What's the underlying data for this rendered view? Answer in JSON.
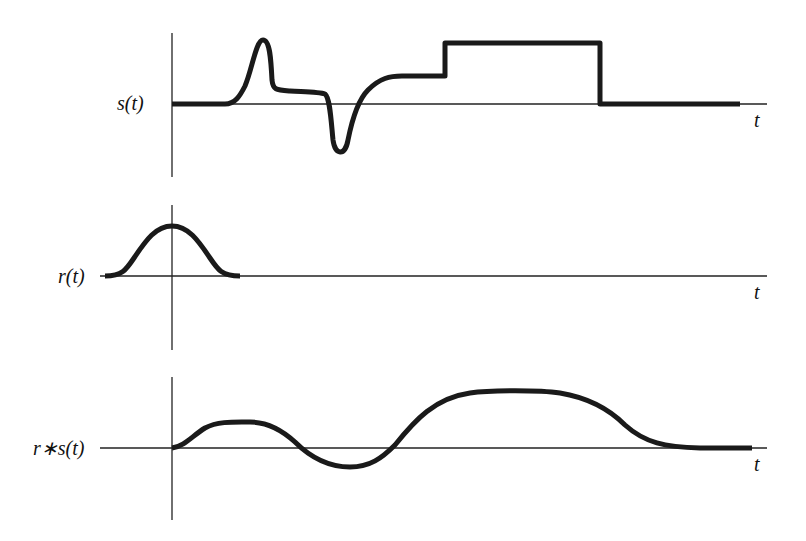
{
  "figure": {
    "panels": [
      {
        "id": "s",
        "label": "s(t)",
        "t_label": "t",
        "description": "Input signal with a positive peak, a negative dip, and a rectangular step"
      },
      {
        "id": "r",
        "label": "r(t)",
        "t_label": "t",
        "description": "Smooth bell-shaped kernel centered at t=0"
      },
      {
        "id": "conv",
        "label": "r∗s(t)",
        "t_label": "t",
        "description": "Convolution of r with s: a smoothed version of s"
      }
    ],
    "colors": {
      "signal": "#1a1a1a",
      "axis": "#222222",
      "background": "#ffffff"
    }
  }
}
